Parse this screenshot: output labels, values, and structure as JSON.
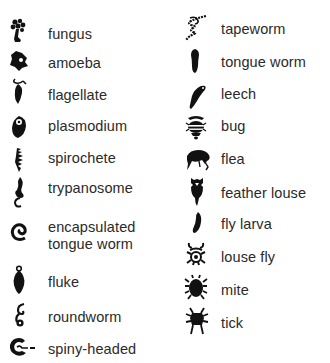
{
  "legend": {
    "left_column": [
      {
        "label": "fungus",
        "icon": "fungus-icon",
        "y": 32
      },
      {
        "label": "amoeba",
        "icon": "amoeba-icon",
        "y": 62
      },
      {
        "label": "flagellate",
        "icon": "flagellate-icon",
        "y": 95
      },
      {
        "label": "plasmodium",
        "icon": "plasmodium-icon",
        "y": 125
      },
      {
        "label": "spirochete",
        "icon": "spirochete-icon",
        "y": 156
      },
      {
        "label": "trypanosome",
        "icon": "trypanosome-icon",
        "y": 187
      },
      {
        "label": "encapsulated",
        "label2": "tongue worm",
        "icon": "encapsulated-tongue-worm-icon",
        "y": 226
      },
      {
        "label": "fluke",
        "icon": "fluke-icon",
        "y": 282
      },
      {
        "label": "roundworm",
        "icon": "roundworm-icon",
        "y": 316
      },
      {
        "label": "spiny-headed",
        "icon": "spiny-headed-icon",
        "y": 348
      }
    ],
    "right_column": [
      {
        "label": "tapeworm",
        "icon": "tapeworm-icon",
        "y": 28
      },
      {
        "label": "tongue worm",
        "icon": "tongue-worm-icon",
        "y": 61
      },
      {
        "label": "leech",
        "icon": "leech-icon",
        "y": 93
      },
      {
        "label": "bug",
        "icon": "bug-icon",
        "y": 125
      },
      {
        "label": "flea",
        "icon": "flea-icon",
        "y": 158
      },
      {
        "label": "feather louse",
        "icon": "feather-louse-icon",
        "y": 192
      },
      {
        "label": "fly larva",
        "icon": "fly-larva-icon",
        "y": 224
      },
      {
        "label": "louse fly",
        "icon": "louse-fly-icon",
        "y": 256
      },
      {
        "label": "mite",
        "icon": "mite-icon",
        "y": 289
      },
      {
        "label": "tick",
        "icon": "tick-icon",
        "y": 322
      }
    ]
  },
  "colors": {
    "icon": "#111111",
    "text": "#2a2a2a",
    "background": "#ffffff"
  }
}
